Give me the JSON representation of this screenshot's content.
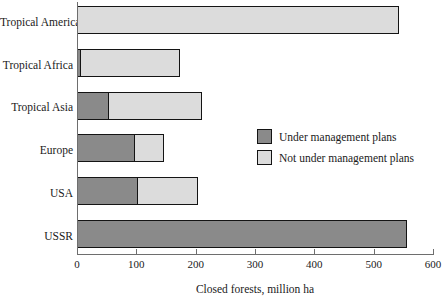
{
  "chart_data": {
    "type": "bar",
    "orientation": "horizontal",
    "stacked": true,
    "title": "",
    "xlabel": "Closed forests, million ha",
    "ylabel": "",
    "xlim": [
      0,
      600
    ],
    "xticks": [
      0,
      100,
      200,
      300,
      400,
      500,
      600
    ],
    "xtick_labels": [
      "0",
      "100",
      "200",
      "300",
      "400",
      "500",
      "600"
    ],
    "grid": false,
    "categories": [
      "Tropical America",
      "Tropical Africa",
      "Tropical Asia",
      "Europe",
      "USA",
      "USSR"
    ],
    "series": [
      {
        "name": "Under management plans",
        "color": "#8a8a8a",
        "values": [
          0,
          4,
          50,
          95,
          100,
          553
        ]
      },
      {
        "name": "Not under management plans",
        "color": "#dcdcdc",
        "values": [
          540,
          166,
          157,
          48,
          100,
          0
        ]
      }
    ],
    "totals": [
      540,
      170,
      207,
      143,
      200,
      553
    ],
    "legend": {
      "position": "inside-right",
      "entries": [
        {
          "label": "Under management plans",
          "swatch": "managed"
        },
        {
          "label": "Not under management plans",
          "swatch": "unmanaged"
        }
      ]
    }
  },
  "colors": {
    "managed": "#8a8a8a",
    "unmanaged": "#dcdcdc",
    "outline": "#141414",
    "axis": "#6e6e6e",
    "background": "#ffffff",
    "text": "#1a1a1a"
  }
}
